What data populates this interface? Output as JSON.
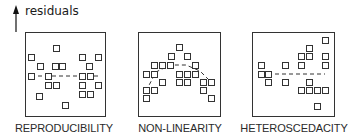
{
  "axis": {
    "label": "residuals"
  },
  "marker_size": 6,
  "colors": {
    "stroke": "#333333",
    "background": "#ffffff"
  },
  "panels": [
    {
      "name": "reproducibility",
      "label": "REPRODUCIBILITY",
      "box": {
        "x": 25,
        "y": 32,
        "w": 80,
        "h": 84
      },
      "label_center_x": 64,
      "trend": {
        "type": "line",
        "points": [
          [
            31,
            76
          ],
          [
            98,
            76
          ]
        ]
      },
      "points": [
        [
          56,
          48
        ],
        [
          31,
          57
        ],
        [
          82,
          57
        ],
        [
          98,
          57
        ],
        [
          40,
          66
        ],
        [
          55,
          66
        ],
        [
          62,
          66
        ],
        [
          89,
          66
        ],
        [
          31,
          76
        ],
        [
          48,
          76
        ],
        [
          82,
          76
        ],
        [
          90,
          76
        ],
        [
          48,
          85
        ],
        [
          56,
          85
        ],
        [
          82,
          85
        ],
        [
          98,
          85
        ],
        [
          39,
          96
        ],
        [
          82,
          94
        ],
        [
          90,
          94
        ],
        [
          65,
          105
        ]
      ]
    },
    {
      "name": "non-linearity",
      "label": "NON-LINEARITY",
      "box": {
        "x": 138,
        "y": 32,
        "w": 82,
        "h": 84
      },
      "label_center_x": 180,
      "trend": {
        "type": "curve",
        "points": [
          [
            146,
            91
          ],
          [
            156,
            72
          ],
          [
            170,
            65
          ],
          [
            186,
            65
          ],
          [
            200,
            71
          ],
          [
            211,
            82
          ]
        ]
      },
      "points": [
        [
          179,
          47
        ],
        [
          171,
          56
        ],
        [
          187,
          56
        ],
        [
          154,
          65
        ],
        [
          162,
          65
        ],
        [
          170,
          65
        ],
        [
          195,
          65
        ],
        [
          146,
          74
        ],
        [
          154,
          74
        ],
        [
          179,
          74
        ],
        [
          187,
          74
        ],
        [
          195,
          74
        ],
        [
          162,
          82
        ],
        [
          179,
          82
        ],
        [
          187,
          82
        ],
        [
          203,
          82
        ],
        [
          211,
          82
        ],
        [
          146,
          90
        ],
        [
          154,
          90
        ],
        [
          203,
          90
        ],
        [
          146,
          98
        ],
        [
          211,
          98
        ]
      ]
    },
    {
      "name": "heteroscedacity",
      "label": "HETEROSCEDACITY",
      "box": {
        "x": 252,
        "y": 32,
        "w": 82,
        "h": 84
      },
      "label_center_x": 294,
      "trend": {
        "type": "line",
        "points": [
          [
            261,
            74
          ],
          [
            325,
            74
          ]
        ]
      },
      "points": [
        [
          325,
          40
        ],
        [
          309,
          48
        ],
        [
          301,
          56
        ],
        [
          309,
          56
        ],
        [
          325,
          56
        ],
        [
          261,
          65
        ],
        [
          285,
          65
        ],
        [
          301,
          65
        ],
        [
          325,
          65
        ],
        [
          261,
          74
        ],
        [
          268,
          74
        ],
        [
          268,
          82
        ],
        [
          285,
          82
        ],
        [
          309,
          82
        ],
        [
          301,
          90
        ],
        [
          309,
          90
        ],
        [
          317,
          90
        ],
        [
          325,
          90
        ],
        [
          317,
          106
        ]
      ]
    }
  ]
}
